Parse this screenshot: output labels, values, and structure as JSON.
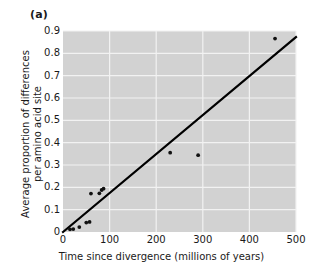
{
  "figure": {
    "panel_label": "(a)",
    "background_color": "#ffffff",
    "plot_background_color": "#d2d2d2",
    "gridline_color": "#f2f2f2",
    "axis_color": "#1a1a1a",
    "point_color": "#111111",
    "line_color": "#000000"
  },
  "chart_data": {
    "type": "scatter",
    "title": "(a)",
    "xlabel": "Time since divergence (millions of years)",
    "ylabel_line1": "Average proportion of differences",
    "ylabel_line2": "per amino acid site",
    "xlim": [
      0,
      500
    ],
    "ylim": [
      0,
      0.9
    ],
    "xticks": [
      0,
      100,
      200,
      300,
      400,
      500
    ],
    "xtick_labels": [
      "0",
      "100",
      "200",
      "300",
      "400",
      "500"
    ],
    "yticks": [
      0,
      0.1,
      0.2,
      0.3,
      0.4,
      0.5,
      0.6,
      0.7,
      0.8,
      0.9
    ],
    "ytick_labels": [
      "0",
      "0.1",
      "0.2",
      "0.3",
      "0.4",
      "0.5",
      "0.6",
      "0.7",
      "0.8",
      "0.9"
    ],
    "grid": true,
    "legend": null,
    "points": [
      {
        "x": 15,
        "y": 0.012
      },
      {
        "x": 22,
        "y": 0.013
      },
      {
        "x": 35,
        "y": 0.022
      },
      {
        "x": 50,
        "y": 0.042
      },
      {
        "x": 57,
        "y": 0.045
      },
      {
        "x": 60,
        "y": 0.172
      },
      {
        "x": 78,
        "y": 0.173
      },
      {
        "x": 83,
        "y": 0.188
      },
      {
        "x": 87,
        "y": 0.194
      },
      {
        "x": 230,
        "y": 0.355
      },
      {
        "x": 290,
        "y": 0.344
      },
      {
        "x": 455,
        "y": 0.866
      }
    ],
    "trendline": {
      "x_start": 0,
      "y_start": 0.0,
      "x_end": 500,
      "y_end": 0.873
    }
  }
}
